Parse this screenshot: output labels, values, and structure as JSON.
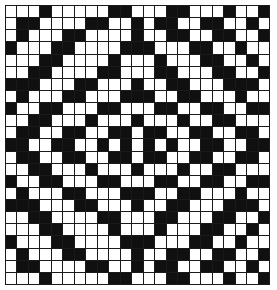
{
  "figure": {
    "name": "symmetric-binary-grid-pattern",
    "rows": 23,
    "cols": 23,
    "colors": {
      "filled": "#101010",
      "empty": "#ffffff",
      "gridline": "#1a1a1a",
      "background": "#ffffff"
    },
    "cell_state_legend": {
      "1": "filled-black-cell",
      "0": "empty-white-cell"
    }
  },
  "chart_data": {
    "type": "heatmap",
    "title": "",
    "xlabel": "",
    "ylabel": "",
    "grid": true,
    "legend": false,
    "rows": 23,
    "cols": 23,
    "values": [
      [
        0,
        0,
        0,
        1,
        0,
        0,
        0,
        0,
        0,
        1,
        1,
        0,
        0,
        0,
        1,
        1,
        0,
        0,
        0,
        1,
        0,
        0,
        1
      ],
      [
        0,
        1,
        1,
        0,
        0,
        0,
        0,
        1,
        1,
        0,
        0,
        1,
        0,
        1,
        1,
        0,
        0,
        1,
        1,
        0,
        0,
        1,
        0
      ],
      [
        0,
        1,
        0,
        0,
        0,
        1,
        1,
        0,
        0,
        0,
        0,
        1,
        0,
        0,
        1,
        1,
        0,
        0,
        1,
        1,
        0,
        0,
        1
      ],
      [
        1,
        0,
        0,
        0,
        1,
        1,
        0,
        0,
        0,
        0,
        1,
        1,
        1,
        0,
        0,
        0,
        1,
        1,
        0,
        0,
        1,
        0,
        0
      ],
      [
        0,
        0,
        0,
        1,
        1,
        0,
        0,
        0,
        0,
        1,
        0,
        0,
        0,
        1,
        0,
        0,
        0,
        1,
        1,
        0,
        0,
        1,
        0
      ],
      [
        0,
        0,
        1,
        1,
        0,
        0,
        0,
        0,
        1,
        1,
        0,
        0,
        0,
        1,
        1,
        0,
        0,
        0,
        1,
        1,
        0,
        0,
        1
      ],
      [
        1,
        1,
        1,
        0,
        0,
        0,
        1,
        1,
        0,
        0,
        0,
        1,
        0,
        0,
        1,
        1,
        0,
        0,
        0,
        1,
        1,
        1,
        0
      ],
      [
        0,
        1,
        0,
        0,
        0,
        1,
        1,
        0,
        0,
        0,
        1,
        1,
        1,
        0,
        0,
        1,
        1,
        0,
        0,
        0,
        1,
        0,
        0
      ],
      [
        1,
        0,
        0,
        1,
        1,
        0,
        0,
        0,
        1,
        1,
        0,
        0,
        0,
        1,
        1,
        0,
        0,
        1,
        1,
        0,
        0,
        1,
        1
      ],
      [
        0,
        0,
        1,
        1,
        0,
        0,
        0,
        1,
        0,
        0,
        0,
        1,
        0,
        0,
        0,
        1,
        0,
        0,
        1,
        1,
        0,
        0,
        0
      ],
      [
        0,
        1,
        1,
        0,
        0,
        1,
        1,
        0,
        0,
        1,
        1,
        0,
        1,
        1,
        0,
        0,
        1,
        1,
        0,
        0,
        1,
        1,
        0
      ],
      [
        1,
        1,
        0,
        0,
        1,
        1,
        0,
        0,
        1,
        0,
        1,
        0,
        1,
        0,
        1,
        0,
        0,
        1,
        1,
        0,
        0,
        1,
        1
      ],
      [
        0,
        1,
        1,
        0,
        0,
        1,
        1,
        0,
        0,
        1,
        1,
        0,
        1,
        1,
        0,
        0,
        1,
        1,
        0,
        0,
        1,
        1,
        0
      ],
      [
        0,
        0,
        1,
        1,
        0,
        0,
        0,
        1,
        0,
        0,
        0,
        1,
        0,
        0,
        0,
        1,
        0,
        0,
        1,
        1,
        0,
        0,
        0
      ],
      [
        1,
        0,
        0,
        1,
        1,
        0,
        0,
        0,
        1,
        1,
        0,
        0,
        0,
        1,
        1,
        0,
        0,
        1,
        1,
        0,
        0,
        1,
        1
      ],
      [
        0,
        1,
        0,
        0,
        0,
        1,
        1,
        0,
        0,
        0,
        1,
        1,
        1,
        0,
        0,
        1,
        1,
        0,
        0,
        0,
        1,
        0,
        0
      ],
      [
        1,
        1,
        1,
        0,
        0,
        0,
        1,
        1,
        0,
        0,
        0,
        1,
        0,
        0,
        1,
        1,
        0,
        0,
        0,
        1,
        1,
        1,
        0
      ],
      [
        0,
        0,
        1,
        1,
        0,
        0,
        0,
        0,
        1,
        1,
        0,
        0,
        0,
        1,
        1,
        0,
        0,
        0,
        1,
        1,
        0,
        0,
        1
      ],
      [
        0,
        0,
        0,
        1,
        1,
        0,
        0,
        0,
        0,
        1,
        0,
        0,
        0,
        1,
        0,
        0,
        0,
        1,
        1,
        0,
        0,
        1,
        0
      ],
      [
        1,
        0,
        0,
        0,
        1,
        1,
        0,
        0,
        0,
        0,
        1,
        1,
        1,
        0,
        0,
        0,
        1,
        1,
        0,
        0,
        1,
        0,
        0
      ],
      [
        0,
        1,
        0,
        0,
        0,
        1,
        1,
        0,
        0,
        0,
        0,
        1,
        0,
        0,
        1,
        1,
        0,
        0,
        1,
        1,
        0,
        0,
        1
      ],
      [
        0,
        1,
        1,
        0,
        0,
        0,
        0,
        1,
        1,
        0,
        0,
        1,
        0,
        1,
        1,
        0,
        0,
        1,
        1,
        0,
        0,
        1,
        0
      ],
      [
        0,
        0,
        0,
        1,
        0,
        0,
        0,
        0,
        0,
        1,
        1,
        0,
        0,
        0,
        1,
        1,
        0,
        0,
        0,
        1,
        0,
        0,
        1
      ]
    ]
  }
}
